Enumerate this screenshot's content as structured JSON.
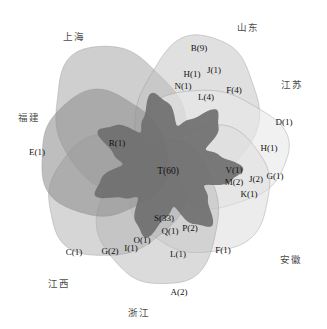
{
  "figure": {
    "type": "venn-diagram",
    "width": 327,
    "height": 329,
    "background": "#ffffff"
  },
  "chart_data": {
    "type": "venn",
    "title": "",
    "set_count": 7,
    "sets": [
      {
        "key": "shanghai",
        "label": "上海",
        "label_x": 63,
        "label_y": 29,
        "fill": "#a8a8a8",
        "opacity": 0.55,
        "cx": 118,
        "cy": 118,
        "rx": 62,
        "ry": 74,
        "rot": -28
      },
      {
        "key": "shandong",
        "label": "山东",
        "label_x": 237,
        "label_y": 20,
        "fill": "#c2c2c2",
        "opacity": 0.5,
        "cx": 196,
        "cy": 112,
        "rx": 60,
        "ry": 76,
        "rot": 18
      },
      {
        "key": "jiangsu",
        "label": "江苏",
        "label_x": 281,
        "label_y": 77,
        "fill": "#e8e8e8",
        "opacity": 0.6,
        "cx": 213,
        "cy": 148,
        "rx": 74,
        "ry": 58,
        "rot": 12
      },
      {
        "key": "anhui",
        "label": "安徽",
        "label_x": 280,
        "label_y": 252,
        "fill": "#dcdcdc",
        "opacity": 0.55,
        "cx": 203,
        "cy": 191,
        "rx": 70,
        "ry": 62,
        "rot": -22
      },
      {
        "key": "zhejiang",
        "label": "浙江",
        "label_x": 128,
        "label_y": 305,
        "fill": "#b8b8b8",
        "opacity": 0.5,
        "cx": 160,
        "cy": 214,
        "rx": 60,
        "ry": 72,
        "rot": 6
      },
      {
        "key": "jiangxi",
        "label": "江西",
        "label_x": 48,
        "label_y": 276,
        "fill": "#b0b0b0",
        "opacity": 0.52,
        "cx": 114,
        "cy": 196,
        "rx": 68,
        "ry": 60,
        "rot": -14
      },
      {
        "key": "fujian",
        "label": "福建",
        "label_x": 18,
        "label_y": 110,
        "fill": "#8f8f8f",
        "opacity": 0.58,
        "cx": 103,
        "cy": 155,
        "rx": 64,
        "ry": 62,
        "rot": 24
      }
    ],
    "regions": [
      {
        "id": "r-T",
        "label": "T(60)",
        "value": 60,
        "letter": "T",
        "x": 168,
        "y": 171,
        "emphasis": "center"
      },
      {
        "id": "r-S",
        "label": "S(33)",
        "value": 33,
        "letter": "S",
        "x": 164,
        "y": 218
      },
      {
        "id": "r-B",
        "label": "B(9)",
        "value": 9,
        "letter": "B",
        "x": 199,
        "y": 48
      },
      {
        "id": "r-L4",
        "label": "L(4)",
        "value": 4,
        "letter": "L",
        "x": 206,
        "y": 97
      },
      {
        "id": "r-F4",
        "label": "F(4)",
        "value": 4,
        "letter": "F",
        "x": 234,
        "y": 90
      },
      {
        "id": "r-J1",
        "label": "J(1)",
        "value": 1,
        "letter": "J",
        "x": 214,
        "y": 70
      },
      {
        "id": "r-H1",
        "label": "H(1)",
        "value": 1,
        "letter": "H",
        "x": 192,
        "y": 74
      },
      {
        "id": "r-N1",
        "label": "N(1)",
        "value": 1,
        "letter": "N",
        "x": 183,
        "y": 86
      },
      {
        "id": "r-D1",
        "label": "D(1)",
        "value": 1,
        "letter": "D",
        "x": 284,
        "y": 122
      },
      {
        "id": "r-H1b",
        "label": "H(1)",
        "value": 1,
        "letter": "H",
        "x": 269,
        "y": 148
      },
      {
        "id": "r-V1",
        "label": "V(1)",
        "value": 1,
        "letter": "V",
        "x": 234,
        "y": 170
      },
      {
        "id": "r-M2",
        "label": "M(2)",
        "value": 2,
        "letter": "M",
        "x": 234,
        "y": 182
      },
      {
        "id": "r-J2",
        "label": "J(2)",
        "value": 2,
        "letter": "J",
        "x": 256,
        "y": 179
      },
      {
        "id": "r-G1",
        "label": "G(1)",
        "value": 1,
        "letter": "G",
        "x": 275,
        "y": 176
      },
      {
        "id": "r-K1",
        "label": "K(1)",
        "value": 1,
        "letter": "K",
        "x": 249,
        "y": 194
      },
      {
        "id": "r-E1",
        "label": "E(1)",
        "value": 1,
        "letter": "E",
        "x": 37,
        "y": 152
      },
      {
        "id": "r-R1",
        "label": "R(1)",
        "value": 1,
        "letter": "R",
        "x": 117,
        "y": 143
      },
      {
        "id": "r-P2",
        "label": "P(2)",
        "value": 2,
        "letter": "P",
        "x": 190,
        "y": 228
      },
      {
        "id": "r-Q1",
        "label": "Q(1)",
        "value": 1,
        "letter": "Q",
        "x": 170,
        "y": 231
      },
      {
        "id": "r-O1",
        "label": "O(1)",
        "value": 1,
        "letter": "O",
        "x": 142,
        "y": 240
      },
      {
        "id": "r-I1",
        "label": "I(1)",
        "value": 1,
        "letter": "I",
        "x": 131,
        "y": 248
      },
      {
        "id": "r-G2",
        "label": "G(2)",
        "value": 2,
        "letter": "G",
        "x": 110,
        "y": 251
      },
      {
        "id": "r-C1",
        "label": "C(1)",
        "value": 1,
        "letter": "C",
        "x": 74,
        "y": 252
      },
      {
        "id": "r-L1",
        "label": "L(1)",
        "value": 1,
        "letter": "L",
        "x": 178,
        "y": 254
      },
      {
        "id": "r-F1",
        "label": "F(1)",
        "value": 1,
        "letter": "F",
        "x": 223,
        "y": 250
      },
      {
        "id": "r-A2",
        "label": "A(2)",
        "value": 2,
        "letter": "A",
        "x": 179,
        "y": 292
      }
    ],
    "core_overlap": {
      "id": "core",
      "fill": "#6f6f6f",
      "label_ref": "T(60)"
    },
    "colors": {
      "background": "#ffffff",
      "stroke": "#909090",
      "core_dark": "#6f6f6f",
      "text": "#111111",
      "set_label_text": "#4b4b4b"
    }
  }
}
